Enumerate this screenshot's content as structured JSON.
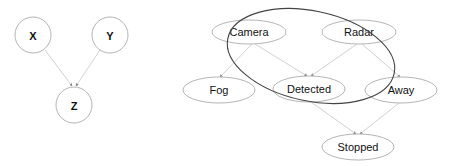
{
  "left_graph": {
    "nodes": [
      {
        "id": "X",
        "label": "X"
      },
      {
        "id": "Y",
        "label": "Y"
      },
      {
        "id": "Z",
        "label": "Z"
      }
    ],
    "edges": [
      [
        "X",
        "Z"
      ],
      [
        "Y",
        "Z"
      ]
    ]
  },
  "right_graph": {
    "nodes": [
      {
        "id": "camera",
        "label": "Camera"
      },
      {
        "id": "radar",
        "label": "Radar"
      },
      {
        "id": "fog",
        "label": "Fog"
      },
      {
        "id": "detected",
        "label": "Detected"
      },
      {
        "id": "away",
        "label": "Away"
      },
      {
        "id": "stopped",
        "label": "Stopped"
      }
    ],
    "edges": [
      [
        "Camera",
        "Fog"
      ],
      [
        "Camera",
        "Detected"
      ],
      [
        "Radar",
        "Detected"
      ],
      [
        "Radar",
        "Away"
      ],
      [
        "Detected",
        "Stopped"
      ],
      [
        "Away",
        "Stopped"
      ]
    ],
    "group_outline": "ellipse enclosing Camera, Radar, Detected"
  },
  "colors": {
    "node_stroke": "#b5b5b5",
    "edge": "#c4c4c4",
    "group_stroke": "#444444",
    "text": "#111111"
  }
}
